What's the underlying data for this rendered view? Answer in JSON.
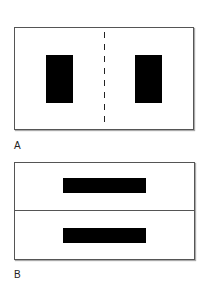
{
  "panels": [
    {
      "label": "A",
      "description": "Frame with two vertical black rectangles separated by a dashed vertical line",
      "frame": {
        "x": 14,
        "y": 27,
        "w": 180,
        "h": 103
      },
      "divider": {
        "type": "dashed-vertical",
        "x": 104
      },
      "blocks": [
        {
          "x": 46,
          "y": 55,
          "w": 27,
          "h": 48
        },
        {
          "x": 135,
          "y": 55,
          "w": 27,
          "h": 48
        }
      ]
    },
    {
      "label": "B",
      "description": "Frame split horizontally by a solid line, each half containing a horizontal black bar",
      "frame": {
        "x": 14,
        "y": 162,
        "w": 181,
        "h": 98
      },
      "divider": {
        "type": "solid-horizontal",
        "y": 211
      },
      "blocks": [
        {
          "x": 63,
          "y": 178,
          "w": 83,
          "h": 15
        },
        {
          "x": 63,
          "y": 228,
          "w": 83,
          "h": 15
        }
      ]
    }
  ],
  "colors": {
    "block": "#000000",
    "frame": "#555555",
    "background": "#ffffff"
  }
}
